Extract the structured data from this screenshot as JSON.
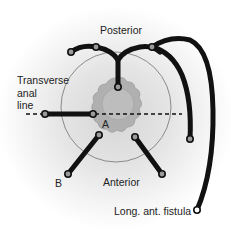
{
  "diagram": {
    "labels": {
      "posterior": "Posterior",
      "transverse_line1": "Transverse",
      "transverse_line2": "anal",
      "transverse_line3": "line",
      "a": "A",
      "b": "B",
      "anterior": "Anterior",
      "long_fistula": "Long. ant. fistula"
    },
    "colors": {
      "tract": "#111111",
      "node_fill": "#9a9a9a",
      "circle": "#8a8a8a",
      "anus": "#a8a8a8",
      "background": "#e0e0e0"
    }
  }
}
